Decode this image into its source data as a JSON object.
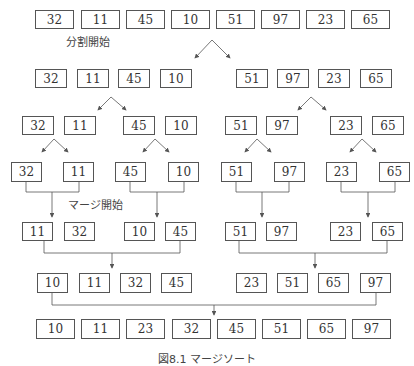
{
  "labels": {
    "split_start": "分割開始",
    "merge_start": "マージ開始",
    "caption": "図8.1 マージソート"
  },
  "rows": [
    {
      "name": "initial",
      "values": [
        32,
        11,
        45,
        10,
        51,
        97,
        23,
        65
      ]
    },
    {
      "name": "split-1",
      "values": [
        32,
        11,
        45,
        10,
        51,
        97,
        23,
        65
      ]
    },
    {
      "name": "split-2",
      "values": [
        32,
        11,
        45,
        10,
        51,
        97,
        23,
        65
      ]
    },
    {
      "name": "split-3",
      "values": [
        32,
        11,
        45,
        10,
        51,
        97,
        23,
        65
      ]
    },
    {
      "name": "merge-1",
      "values": [
        11,
        32,
        10,
        45,
        51,
        97,
        23,
        65
      ]
    },
    {
      "name": "merge-2",
      "values": [
        10,
        11,
        32,
        45,
        23,
        51,
        65,
        97
      ]
    },
    {
      "name": "merge-3",
      "values": [
        10,
        11,
        23,
        32,
        45,
        51,
        65,
        97
      ]
    }
  ],
  "colors": {
    "border": "#555555",
    "text": "#333333",
    "line": "#555555",
    "background": "#ffffff"
  }
}
